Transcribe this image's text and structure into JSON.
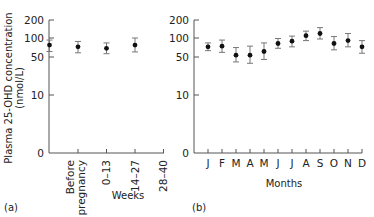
{
  "chart_data": [
    {
      "type": "scatter",
      "panel": "(a)",
      "title": "",
      "ylabel": "Plasma 25-OHD concentration (nmol/L)",
      "xlabel": "Weeks",
      "yscale": "log",
      "yticks": [
        "200",
        "100",
        "50",
        "10",
        "0"
      ],
      "ylim": [
        0,
        200
      ],
      "categories": [
        "Before pregnancy",
        "0–13",
        "14–27",
        "28–40"
      ],
      "values": [
        75,
        70,
        66,
        75
      ],
      "error_low": [
        58,
        55,
        53,
        57
      ],
      "error_high": [
        92,
        87,
        82,
        100
      ],
      "grid": false
    },
    {
      "type": "scatter",
      "panel": "(b)",
      "title": "",
      "ylabel": "",
      "xlabel": "Months",
      "yscale": "log",
      "yticks": [
        "200",
        "100",
        "50",
        "10",
        "0"
      ],
      "ylim": [
        0,
        200
      ],
      "categories": [
        "J",
        "F",
        "M",
        "A",
        "M",
        "J",
        "J",
        "A",
        "S",
        "O",
        "N",
        "D"
      ],
      "values": [
        70,
        72,
        50,
        50,
        58,
        80,
        88,
        110,
        120,
        80,
        90,
        70
      ],
      "error_low": [
        60,
        56,
        38,
        36,
        42,
        66,
        70,
        90,
        96,
        62,
        70,
        54
      ],
      "error_high": [
        82,
        92,
        68,
        72,
        82,
        98,
        108,
        132,
        152,
        106,
        120,
        90
      ],
      "grid": false
    }
  ],
  "panel_a": {
    "label": "(a)",
    "xlabel": "Weeks",
    "ylabel_line1": "Plasma 25-OHD concentration",
    "ylabel_line2": "(nmol/L)",
    "yticks": [
      "200",
      "100",
      "50",
      "10",
      "0"
    ],
    "categories": [
      [
        "Before",
        "pregnancy"
      ],
      [
        "0–13"
      ],
      [
        "14–27"
      ],
      [
        "28–40"
      ]
    ]
  },
  "panel_b": {
    "label": "(b)",
    "xlabel": "Months",
    "yticks": [
      "200",
      "100",
      "50",
      "10",
      "0"
    ],
    "categories": [
      "J",
      "F",
      "M",
      "A",
      "M",
      "J",
      "J",
      "A",
      "S",
      "O",
      "N",
      "D"
    ]
  },
  "colors": {
    "axis": "#555555",
    "point": "#111111",
    "errorbar": "#777777"
  }
}
